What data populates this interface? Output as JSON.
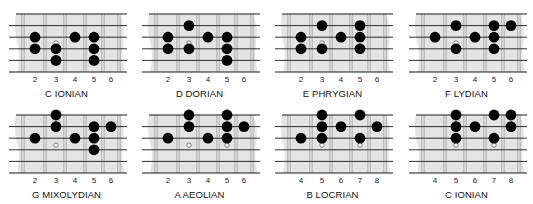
{
  "colors": {
    "board": "#e4e4e4",
    "string": "#1a1a1a",
    "fret": "#8a8a8a",
    "dot": "#000000"
  },
  "diagrams": [
    {
      "title": "C IONIAN",
      "frets": [
        "2",
        "3",
        "4",
        "5",
        "6"
      ],
      "dots": [
        [
          0,
          2
        ],
        [
          0,
          3
        ],
        [
          1,
          3
        ],
        [
          1,
          4
        ],
        [
          2,
          2
        ],
        [
          3,
          2
        ],
        [
          3,
          3
        ],
        [
          3,
          4
        ]
      ],
      "open": [
        [
          1,
          2.5
        ]
      ]
    },
    {
      "title": "D DORIAN",
      "frets": [
        "2",
        "3",
        "4",
        "5",
        "6"
      ],
      "dots": [
        [
          0,
          2
        ],
        [
          0,
          3
        ],
        [
          1,
          1
        ],
        [
          1,
          3
        ],
        [
          2,
          2
        ],
        [
          3,
          2
        ],
        [
          3,
          3
        ],
        [
          3,
          4
        ]
      ],
      "open": [
        [
          1,
          2.5
        ]
      ]
    },
    {
      "title": "E PHRYGIAN",
      "frets": [
        "2",
        "3",
        "4",
        "5",
        "6"
      ],
      "dots": [
        [
          0,
          2
        ],
        [
          0,
          3
        ],
        [
          1,
          1
        ],
        [
          1,
          3
        ],
        [
          2,
          2
        ],
        [
          3,
          1
        ],
        [
          3,
          2
        ],
        [
          3,
          3
        ]
      ],
      "open": [
        [
          1,
          2.5
        ]
      ]
    },
    {
      "title": "F LYDIAN",
      "frets": [
        "2",
        "3",
        "4",
        "5",
        "6"
      ],
      "dots": [
        [
          0,
          2
        ],
        [
          1,
          1
        ],
        [
          1,
          3
        ],
        [
          2,
          2
        ],
        [
          3,
          1
        ],
        [
          3,
          2
        ],
        [
          3,
          3
        ],
        [
          4,
          1
        ]
      ],
      "open": [
        [
          1,
          2.5
        ]
      ]
    },
    {
      "title": "G MIXOLYDIAN",
      "frets": [
        "2",
        "3",
        "4",
        "5",
        "6"
      ],
      "dots": [
        [
          0,
          2
        ],
        [
          1,
          0
        ],
        [
          1,
          1
        ],
        [
          2,
          2
        ],
        [
          3,
          1
        ],
        [
          3,
          2
        ],
        [
          3,
          3
        ],
        [
          4,
          1
        ]
      ],
      "open": [
        [
          1,
          2.6
        ]
      ]
    },
    {
      "title": "A AEOLIAN",
      "frets": [
        "2",
        "3",
        "4",
        "5",
        "6"
      ],
      "dots": [
        [
          0,
          2
        ],
        [
          1,
          0
        ],
        [
          1,
          1
        ],
        [
          2,
          2
        ],
        [
          3,
          0
        ],
        [
          3,
          1
        ],
        [
          3,
          2
        ],
        [
          4,
          1
        ]
      ],
      "open": [
        [
          1,
          2.6
        ],
        [
          3,
          2.6
        ]
      ]
    },
    {
      "title": "B LOCRIAN",
      "frets": [
        "4",
        "5",
        "6",
        "7",
        "8"
      ],
      "dots": [
        [
          0,
          2
        ],
        [
          1,
          0
        ],
        [
          1,
          1
        ],
        [
          1,
          2
        ],
        [
          2,
          1
        ],
        [
          3,
          0
        ],
        [
          3,
          2
        ],
        [
          4,
          1
        ]
      ],
      "open": [
        [
          1,
          2.6
        ],
        [
          3,
          2.6
        ]
      ]
    },
    {
      "title": "C IONIAN",
      "frets": [
        "4",
        "5",
        "6",
        "7",
        "8"
      ],
      "dots": [
        [
          1,
          0
        ],
        [
          1,
          1
        ],
        [
          1,
          2
        ],
        [
          2,
          1
        ],
        [
          3,
          0
        ],
        [
          3,
          2
        ],
        [
          4,
          0
        ],
        [
          4,
          1
        ]
      ],
      "open": [
        [
          1,
          2.6
        ],
        [
          3,
          2.6
        ]
      ]
    }
  ]
}
